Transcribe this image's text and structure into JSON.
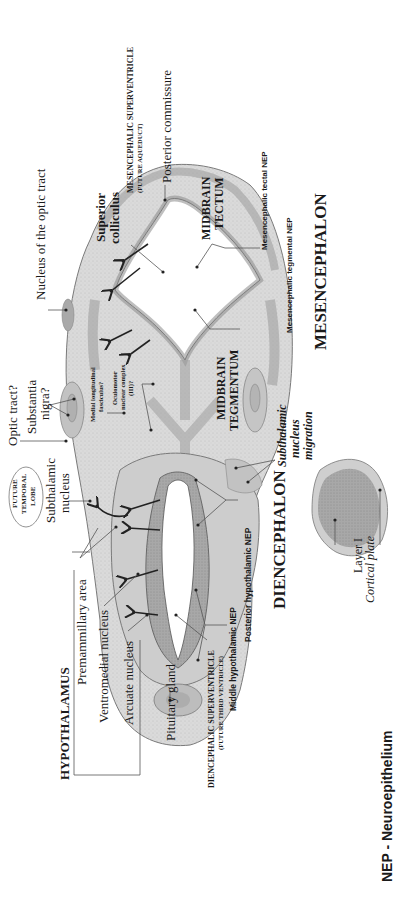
{
  "figure": {
    "orientation": "rotated 90deg counter-clockwise",
    "footnote": "NEP - Neuroepithelium",
    "regions": {
      "mesencephalon": "MESENCEPHALON",
      "diencephalon": "DIENCEPHALON",
      "hypothalamus": "HYPOTHALAMUS"
    },
    "labels": {
      "nucleus_optic_tract": "Nucleus of the optic tract",
      "posterior_commissure": "Posterior commissure",
      "mesencephalic_superventricle": "MESENCEPHALIC SUPERVENTRICLE",
      "future_aqueduct": "(FUTURE AQUEDUCT)",
      "superior_colliculus_1": "Superior",
      "superior_colliculus_2": "colliculus",
      "midbrain_tectum_1": "MIDBRAIN",
      "midbrain_tectum_2": "TECTUM",
      "mesencephalic_tectal_nep": "Mesencephalic tectal NEP",
      "mesencephalic_tegmental_nep": "Mesencephalic tegmental NEP",
      "midbrain_tegmentum_1": "MIDBRAIN",
      "midbrain_tegmentum_2": "TEGMENTUM",
      "optic_tract": "Optic tract?",
      "substantia_nigra_1": "Substantia",
      "substantia_nigra_2": "nigra?",
      "medial_longitudinal_1": "Medial longitudinal",
      "medial_longitudinal_2": "fasciculus?",
      "oculomotor_1": "Oculomotor",
      "oculomotor_2": "nuclear complex",
      "oculomotor_3": "(III)?",
      "future_temporal_lobe_1": "FUTURE",
      "future_temporal_lobe_2": "TEMPORAL",
      "future_temporal_lobe_3": "LOBE",
      "subthalamic_nucleus_1": "Subthalamic",
      "subthalamic_nucleus_2": "nucleus",
      "subthalamic_migration_1": "Subthalamic",
      "subthalamic_migration_2": "nucleus",
      "subthalamic_migration_3": "migration",
      "premammillary_area": "Premammillary area",
      "ventromedial_nucleus": "Ventromedial nucleus",
      "arcuate_nucleus": "Arcuate nucleus",
      "pituitary_gland": "Pituitary gland",
      "diencephalic_superventricle": "DIENCEPHALIC SUPERVENTRICLE",
      "future_third_ventricle": "(FUTURE THIRD VENTRICLE)",
      "middle_hypothalamic_nep": "Middle hypothalamic NEP",
      "posterior_hypothalamic_nep": "Posterior hypothalamic NEP",
      "layer_i": "Layer I",
      "cortical_plate": "Cortical plate"
    },
    "colors": {
      "tissue": "#d4d4d4",
      "tissue_dark": "#a9a9a9",
      "nep": "#8c8c8c",
      "outline": "#6e6e6e",
      "leader": "#555555",
      "text": "#1a1a1a"
    }
  }
}
